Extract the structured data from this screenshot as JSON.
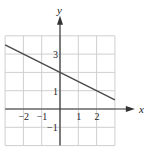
{
  "chart_data": {
    "type": "line",
    "title": "",
    "xlabel": "x",
    "ylabel": "y",
    "xlim": [
      -3,
      3
    ],
    "ylim": [
      -2,
      4
    ],
    "grid": true,
    "x_ticks": [
      {
        "v": -2,
        "label": "−2"
      },
      {
        "v": -1,
        "label": "−1"
      },
      {
        "v": 1,
        "label": "1"
      },
      {
        "v": 2,
        "label": "2"
      }
    ],
    "y_ticks": [
      {
        "v": 3,
        "label": "3"
      },
      {
        "v": 1,
        "label": "1"
      },
      {
        "v": -1,
        "label": "−1"
      }
    ],
    "series": [
      {
        "name": "line",
        "equation": "y = -x/2 + 2",
        "x": [
          -3,
          3
        ],
        "y": [
          3.5,
          0.5
        ]
      }
    ]
  },
  "colors": {
    "grid": "#cfcfcf",
    "axis": "#333333",
    "line": "#4a4a4a"
  }
}
